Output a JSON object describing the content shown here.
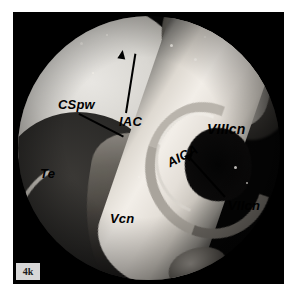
{
  "figure": {
    "panel_tag": "4k",
    "modality": "endoscopic surgical photograph",
    "view_shape": "circular",
    "palette": {
      "background": "#ffffff",
      "plate": "#000000",
      "label_color": "#000000",
      "panel_tag_bg": "#d7d7d7",
      "tissue_highlight": "#f2eee8",
      "tissue_midtone": "#8e8b86",
      "tissue_shadow": "#0a0a09"
    }
  },
  "annotations": [
    {
      "id": "cspw",
      "label": "CSpw",
      "full_name": "cerebellar surface / posterior wall",
      "marker": "leader-line",
      "x": 58,
      "y": 98,
      "font_size": 13
    },
    {
      "id": "iac",
      "label": "IAC",
      "full_name": "internal acoustic canal",
      "marker": "arrow",
      "x": 119,
      "y": 110,
      "font_size": 13
    },
    {
      "id": "te",
      "label": "Te",
      "full_name": "tentorium",
      "marker": "none",
      "x": 40,
      "y": 165,
      "font_size": 13
    },
    {
      "id": "vcn",
      "label": "Vcn",
      "full_name": "trigeminal cranial nerve",
      "marker": "none",
      "x": 110,
      "y": 210,
      "font_size": 13
    },
    {
      "id": "aica",
      "label": "AICA",
      "full_name": "anterior inferior cerebellar artery",
      "marker": "none",
      "x": 168,
      "y": 155,
      "rotation": -28,
      "font_size": 13
    },
    {
      "id": "viicn",
      "label": "VIIcn",
      "full_name": "facial cranial nerve",
      "marker": "arrow",
      "x": 228,
      "y": 197,
      "font_size": 13
    },
    {
      "id": "viiicn",
      "label": "VIIIcn",
      "full_name": "vestibulocochlear cranial nerve",
      "marker": "none",
      "x": 207,
      "y": 120,
      "font_size": 14
    }
  ]
}
